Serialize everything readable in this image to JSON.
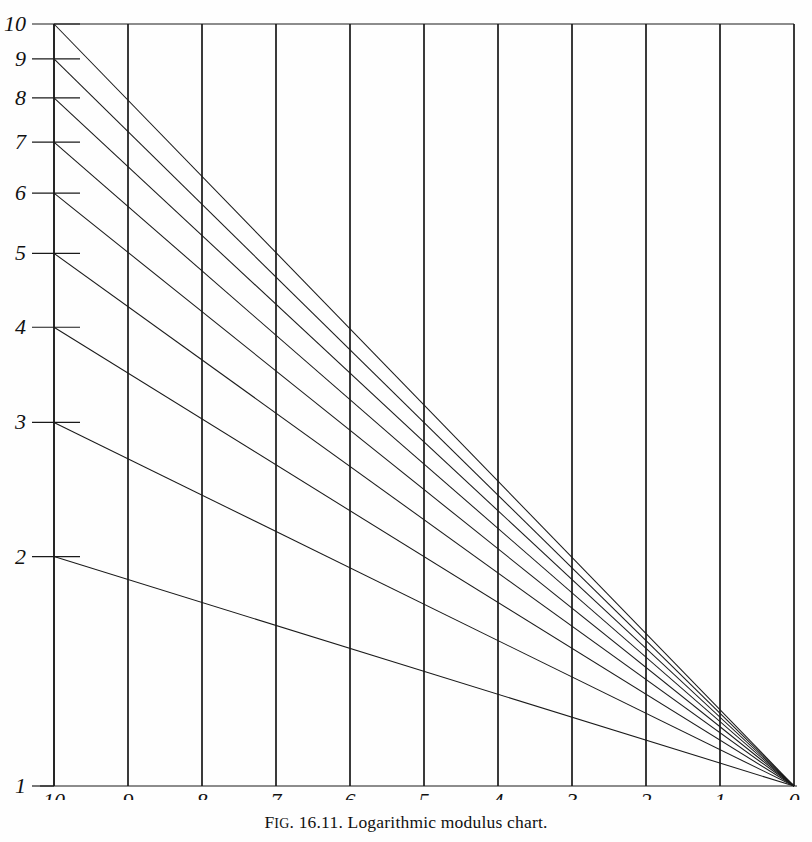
{
  "caption": {
    "fig_prefix_first": "F",
    "fig_prefix_rest": "IG",
    "fig_number": ". 16.11. ",
    "title": "Logarithmic modulus chart.",
    "full": "FIG. 16.11. Logarithmic modulus chart."
  },
  "chart_data": {
    "type": "line",
    "title": "Logarithmic modulus chart",
    "xlabel": "",
    "ylabel": "",
    "x_scale": "linear",
    "y_scale": "log",
    "xlim": [
      10,
      0
    ],
    "ylim": [
      1,
      10
    ],
    "x_ticks": [
      10,
      9,
      8,
      7,
      6,
      5,
      4,
      3,
      2,
      1,
      0
    ],
    "x_tick_labels": [
      "10",
      "9",
      "8",
      "7",
      "6",
      "5",
      "4",
      "3",
      "2",
      "1",
      "0"
    ],
    "y_ticks": [
      1,
      2,
      3,
      4,
      5,
      6,
      7,
      8,
      9,
      10
    ],
    "y_tick_labels": [
      "1",
      "2",
      "3",
      "4",
      "5",
      "6",
      "7",
      "8",
      "9",
      "10"
    ],
    "grid": true,
    "grid_axis": "x",
    "legend": null,
    "annotations": [],
    "series": [
      {
        "name": "modulus-10",
        "start_y": 10,
        "end_y": 1,
        "x": [
          10,
          0
        ],
        "values": [
          10,
          1
        ]
      },
      {
        "name": "modulus-9",
        "start_y": 9,
        "end_y": 1,
        "x": [
          10,
          0
        ],
        "values": [
          9,
          1
        ]
      },
      {
        "name": "modulus-8",
        "start_y": 8,
        "end_y": 1,
        "x": [
          10,
          0
        ],
        "values": [
          8,
          1
        ]
      },
      {
        "name": "modulus-7",
        "start_y": 7,
        "end_y": 1,
        "x": [
          10,
          0
        ],
        "values": [
          7,
          1
        ]
      },
      {
        "name": "modulus-6",
        "start_y": 6,
        "end_y": 1,
        "x": [
          10,
          0
        ],
        "values": [
          6,
          1
        ]
      },
      {
        "name": "modulus-5",
        "start_y": 5,
        "end_y": 1,
        "x": [
          10,
          0
        ],
        "values": [
          5,
          1
        ]
      },
      {
        "name": "modulus-4",
        "start_y": 4,
        "end_y": 1,
        "x": [
          10,
          0
        ],
        "values": [
          4,
          1
        ]
      },
      {
        "name": "modulus-3",
        "start_y": 3,
        "end_y": 1,
        "x": [
          10,
          0
        ],
        "values": [
          3,
          1
        ]
      },
      {
        "name": "modulus-2",
        "start_y": 2,
        "end_y": 1,
        "x": [
          10,
          0
        ],
        "values": [
          2,
          1
        ]
      }
    ]
  },
  "colors": {
    "ink": "#1a1a1a",
    "grid": "#3a3a3a",
    "paper": "#fefefe"
  },
  "geometry": {
    "plot_left": 54,
    "plot_right": 794,
    "plot_top": 24,
    "plot_bottom": 786
  }
}
